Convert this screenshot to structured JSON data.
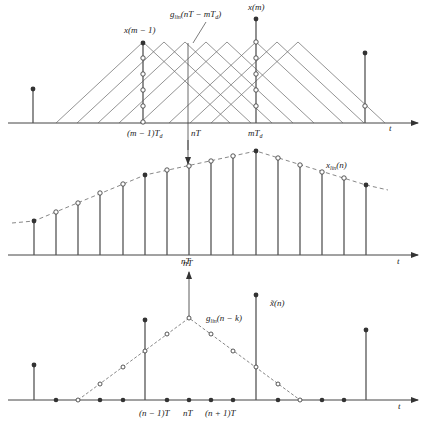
{
  "labels": {
    "top_x_m_minus_1": "x(m − 1)",
    "top_x_m": "x(m)",
    "top_kernel": "g_lin(nT − mT_d)",
    "top_kernel_base": "g",
    "top_kernel_sub": "lin",
    "top_kernel_arg": "(nT − mT",
    "top_kernel_arg_sub": "d",
    "top_kernel_close": ")",
    "top_tick_m_minus_1": "(m − 1)T",
    "top_tick_m_minus_1_sub": "d",
    "top_tick_nT": "nT",
    "top_tick_m": "mT",
    "top_tick_m_sub": "d",
    "top_axis_t": "t",
    "mid_series": "x_lin(n)",
    "mid_series_base": "x",
    "mid_series_sub": "lin",
    "mid_series_arg": "(n)",
    "mid_tick_nT": "nT",
    "mid_axis_t": "t",
    "bot_kernel_base": "g",
    "bot_kernel_sub": "lin",
    "bot_kernel_arg": "(n − k)",
    "bot_series": "x̃(n)",
    "bot_tick_n_minus_1": "(n − 1)T",
    "bot_tick_n": "nT",
    "bot_tick_n_plus_1": "(n + 1)T",
    "bot_axis_t": "t",
    "caption": "Linear interpolation resampling illustration"
  },
  "colors": {
    "axis": "#444444",
    "stem": "#555555",
    "kernel_line": "#666666",
    "envelope_dash": "#888888",
    "filled_dot": "#333333",
    "open_circle_stroke": "#444444"
  },
  "panels": {
    "top": {
      "description": "Input samples x(m) at spacing T_d with overlapping triangular linear-interpolation kernels; vertical line at output time nT",
      "input_stems": [
        {
          "label": "",
          "relative_height": 0.34
        },
        {
          "label": "x(m − 1)",
          "relative_height": 0.8
        },
        {
          "label": "x(m)",
          "relative_height": 1.0
        },
        {
          "label": "",
          "relative_height": 0.67
        }
      ]
    },
    "middle": {
      "description": "Interpolated output sequence x_lin(n) with dashed linear envelope",
      "stem_count": 16,
      "filled_indices": [
        0,
        5,
        10,
        15
      ]
    },
    "bottom": {
      "description": "Zero-stuffed sequence x̃(n) convolved with triangular kernel g_lin(n − k) centered at nT",
      "dot_count": 16,
      "nonzero_stem_indices": [
        0,
        5,
        10,
        15
      ]
    }
  }
}
